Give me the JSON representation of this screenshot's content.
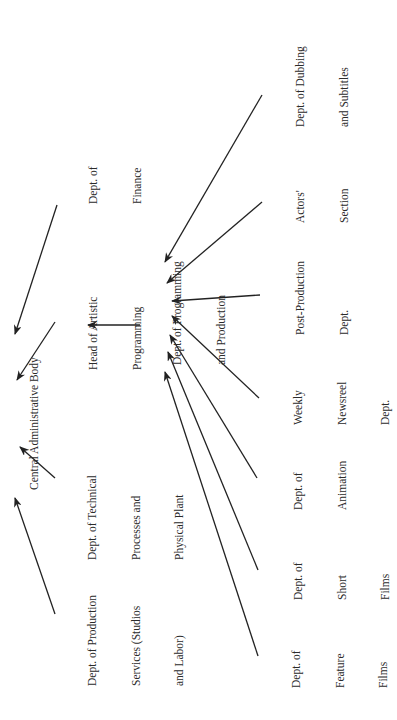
{
  "diagram": {
    "orientation": "rotated -90 degrees (reads bottom-to-top)",
    "line_color": "#222222",
    "text_color": "#2b2b2b",
    "nodes": {
      "central": {
        "lines": [
          "Central Administrative Body"
        ]
      },
      "finance": {
        "lines": [
          "Dept. of",
          "Finance"
        ]
      },
      "head_artistic": {
        "lines": [
          "Head of Artistic",
          "Programming"
        ]
      },
      "technical": {
        "lines": [
          "Dept. of Technical",
          "Processes and",
          "Physical Plant"
        ]
      },
      "production_services": {
        "lines": [
          "Dept. of Production",
          "Services (Studios",
          "and Labor)"
        ]
      },
      "programming": {
        "lines": [
          "Dept. of Programming",
          "and Production"
        ]
      },
      "dubbing": {
        "lines": [
          "Dept. of Dubbing",
          "and Subtitles"
        ]
      },
      "actors": {
        "lines": [
          "Actors'",
          "Section"
        ]
      },
      "post_production": {
        "lines": [
          "Post-Production",
          "Dept."
        ]
      },
      "newsreel": {
        "lines": [
          "Weekly",
          "Newsreel",
          "Dept."
        ]
      },
      "animation": {
        "lines": [
          "Dept. of",
          "Animation"
        ]
      },
      "short_films": {
        "lines": [
          "Dept. of",
          "Short",
          "Films"
        ]
      },
      "feature_films": {
        "lines": [
          "Dept. of",
          "Feature",
          "Films"
        ]
      }
    },
    "edges": [
      {
        "from": "Dept. of Finance",
        "to": "Central Administrative Body"
      },
      {
        "from": "Head of Artistic Programming",
        "to": "Central Administrative Body"
      },
      {
        "from": "Dept. of Technical Processes and Physical Plant",
        "to": "Central Administrative Body"
      },
      {
        "from": "Dept. of Production Services (Studios and Labor)",
        "to": "Central Administrative Body"
      },
      {
        "from": "Dept. of Programming and Production",
        "to": "Head of Artistic Programming"
      },
      {
        "from": "Dept. of Dubbing and Subtitles",
        "to": "Dept. of Programming and Production"
      },
      {
        "from": "Actors' Section",
        "to": "Dept. of Programming and Production"
      },
      {
        "from": "Post-Production Dept.",
        "to": "Dept. of Programming and Production"
      },
      {
        "from": "Weekly Newsreel Dept.",
        "to": "Dept. of Programming and Production"
      },
      {
        "from": "Dept. of Animation",
        "to": "Dept. of Programming and Production"
      },
      {
        "from": "Dept. of Short Films",
        "to": "Dept. of Programming and Production"
      },
      {
        "from": "Dept. of Feature Films",
        "to": "Dept. of Programming and Production"
      }
    ]
  }
}
